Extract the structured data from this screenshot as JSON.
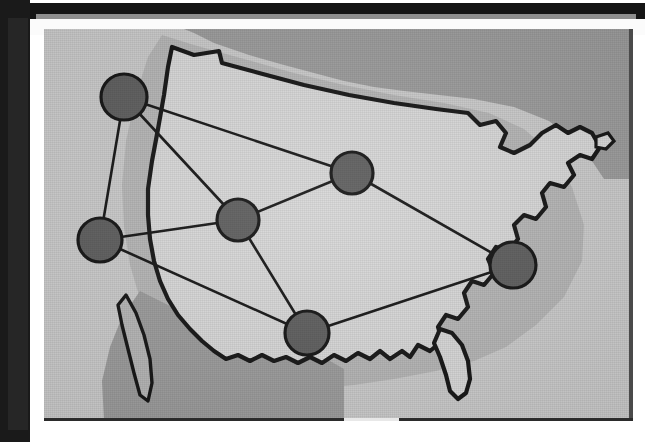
{
  "figure": {
    "kind": "map-diagram",
    "caption": ""
  },
  "palette": {
    "page_background": "#ffffff",
    "binding_bar": "#1a1a1a",
    "frame_shadow": "#151515",
    "ocean_background": "#c9c9c9",
    "us_landmass": "#d7d7d7",
    "canada_mexico": "#9a9a9a",
    "coastal_band": "#b4b4b4",
    "border_outline": "#101010",
    "node_fill": "#5b5b5b",
    "node_stroke": "#0f0f0f",
    "edge_stroke": "#101010",
    "panel_rule": "#2b2b2b"
  },
  "map": {
    "projection_note": "conterminous United States, simplified outline",
    "regions": [
      {
        "name": "united-states-landmass",
        "shade": "#d7d7d7"
      },
      {
        "name": "canada",
        "shade": "#9a9a9a"
      },
      {
        "name": "mexico",
        "shade": "#9a9a9a"
      },
      {
        "name": "great-lakes",
        "shade": "#9a9a9a"
      },
      {
        "name": "coastal-halo-band",
        "shade": "#b4b4b4"
      }
    ],
    "landmarks": [
      {
        "name": "florida-peninsula"
      },
      {
        "name": "baja-california"
      },
      {
        "name": "great-lakes"
      },
      {
        "name": "maine-northeast"
      },
      {
        "name": "long-island"
      }
    ]
  },
  "network": {
    "node_count": 6,
    "edge_count": 8,
    "node_radius": 22,
    "nodes": [
      {
        "id": "nw",
        "label": "",
        "region": "pacific-northwest",
        "cx": 80,
        "cy": 68,
        "r": 23,
        "degree": 3
      },
      {
        "id": "west",
        "label": "",
        "region": "northern-california",
        "cx": 56,
        "cy": 211,
        "r": 22,
        "degree": 3
      },
      {
        "id": "central",
        "label": "",
        "region": "mountain-west",
        "cx": 194,
        "cy": 191,
        "r": 21,
        "degree": 4
      },
      {
        "id": "north",
        "label": "",
        "region": "upper-midwest",
        "cx": 308,
        "cy": 144,
        "r": 21,
        "degree": 3
      },
      {
        "id": "south",
        "label": "",
        "region": "gulf-coast-texas",
        "cx": 263,
        "cy": 304,
        "r": 22,
        "degree": 3
      },
      {
        "id": "east",
        "label": "",
        "region": "mid-atlantic",
        "cx": 469,
        "cy": 236,
        "r": 23,
        "degree": 2
      }
    ],
    "edges": [
      {
        "from": "nw",
        "to": "north"
      },
      {
        "from": "nw",
        "to": "central"
      },
      {
        "from": "nw",
        "to": "west"
      },
      {
        "from": "west",
        "to": "central"
      },
      {
        "from": "west",
        "to": "south"
      },
      {
        "from": "central",
        "to": "north"
      },
      {
        "from": "central",
        "to": "south"
      },
      {
        "from": "north",
        "to": "east"
      },
      {
        "from": "south",
        "to": "east"
      }
    ]
  }
}
